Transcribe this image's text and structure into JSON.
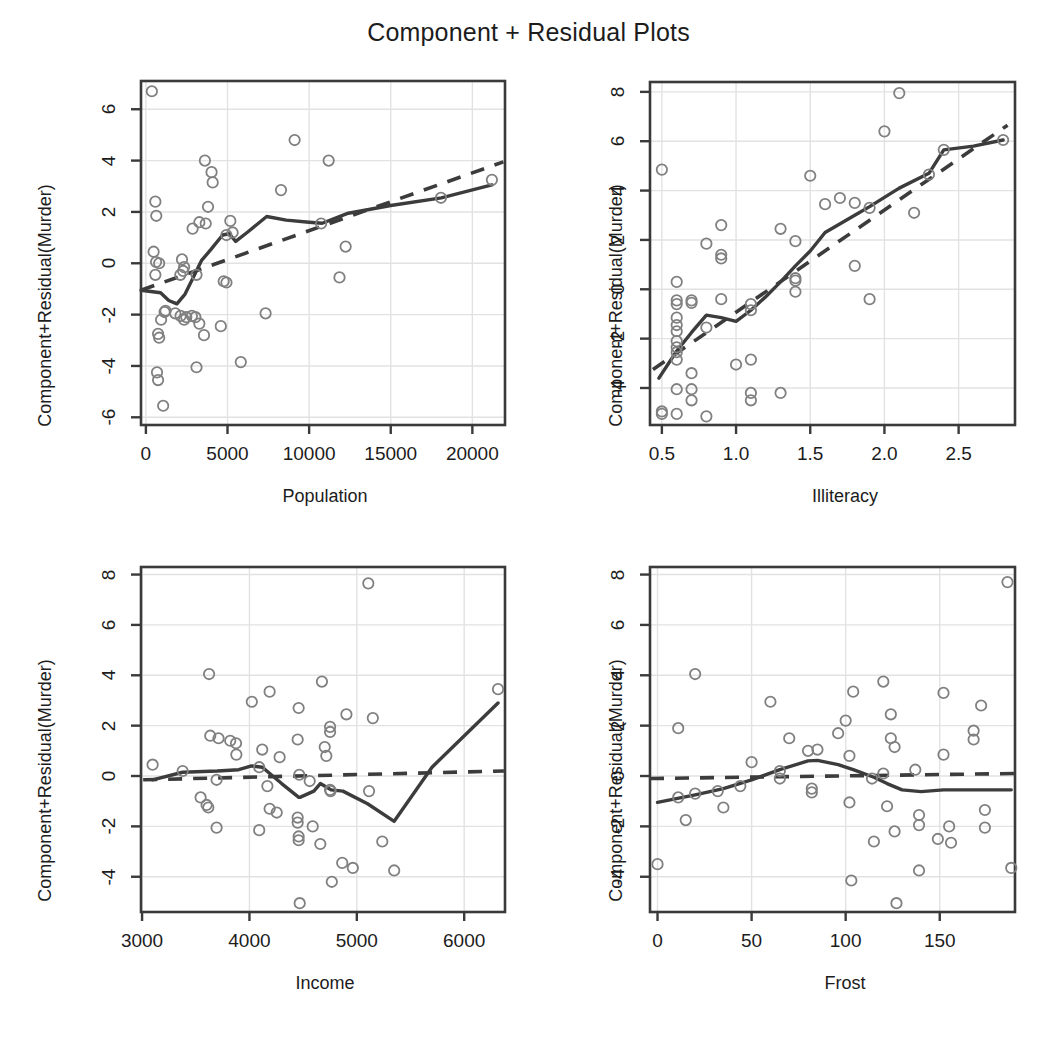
{
  "figure": {
    "title": "Component + Residual Plots",
    "background": "#ffffff",
    "point_color": "#808080",
    "line_color": "#3c3c3c",
    "frame_color": "#3a3a3a",
    "grid_color": "#e2e2e2",
    "text_color": "#1c1c1c"
  },
  "chart_data": [
    {
      "type": "scatter",
      "panel": "top-left",
      "title": "Component + Residual Plots",
      "xlabel": "Population",
      "ylabel": "Component+Residual(Murder)",
      "xlim": [
        -300,
        22000
      ],
      "ylim": [
        -6.3,
        7.1
      ],
      "xticks": [
        0,
        5000,
        10000,
        15000,
        20000
      ],
      "yticks": [
        -6,
        -4,
        -2,
        0,
        2,
        4,
        6
      ],
      "xticklabels": [
        "0",
        "5000",
        "10000",
        "15000",
        "20000"
      ],
      "yticklabels": [
        "-6",
        "-4",
        "-2",
        "0",
        "2",
        "4",
        "6"
      ],
      "grid": true,
      "legend": "none",
      "points": [
        [
          365,
          6.7
        ],
        [
          579,
          2.4
        ],
        [
          637,
          1.85
        ],
        [
          472,
          0.45
        ],
        [
          623,
          0.05
        ],
        [
          812,
          0.0
        ],
        [
          579,
          -0.45
        ],
        [
          1203,
          -1.85
        ],
        [
          931,
          -2.2
        ],
        [
          1144,
          -1.9
        ],
        [
          746,
          -2.75
        ],
        [
          813,
          -2.9
        ],
        [
          681,
          -4.25
        ],
        [
          746,
          -4.55
        ],
        [
          1058,
          -5.55
        ],
        [
          2341,
          -0.15
        ],
        [
          2212,
          0.15
        ],
        [
          2110,
          -0.45
        ],
        [
          2861,
          1.35
        ],
        [
          2284,
          -0.3
        ],
        [
          3100,
          -0.45
        ],
        [
          3615,
          4.0
        ],
        [
          4022,
          3.55
        ],
        [
          4091,
          3.15
        ],
        [
          3806,
          2.2
        ],
        [
          3274,
          1.6
        ],
        [
          3665,
          1.55
        ],
        [
          4931,
          1.1
        ],
        [
          5313,
          1.2
        ],
        [
          5173,
          1.65
        ],
        [
          2341,
          -2.2
        ],
        [
          2816,
          -2.05
        ],
        [
          3032,
          -2.1
        ],
        [
          3274,
          -2.35
        ],
        [
          2477,
          -2.1
        ],
        [
          1799,
          -1.95
        ],
        [
          2126,
          -2.05
        ],
        [
          3559,
          -2.8
        ],
        [
          4589,
          -2.45
        ],
        [
          3100,
          -4.05
        ],
        [
          5814,
          -3.85
        ],
        [
          4767,
          -0.7
        ],
        [
          4935,
          -0.75
        ],
        [
          7333,
          -1.95
        ],
        [
          8277,
          2.85
        ],
        [
          9111,
          4.8
        ],
        [
          10735,
          1.55
        ],
        [
          11197,
          4.0
        ],
        [
          11860,
          -0.55
        ],
        [
          12237,
          0.65
        ],
        [
          18076,
          2.55
        ],
        [
          21198,
          3.25
        ]
      ],
      "lowess": [
        [
          -300,
          -1.05
        ],
        [
          900,
          -1.15
        ],
        [
          1400,
          -1.45
        ],
        [
          1900,
          -1.58
        ],
        [
          2400,
          -1.2
        ],
        [
          2900,
          -0.55
        ],
        [
          3400,
          0.1
        ],
        [
          4000,
          0.55
        ],
        [
          4700,
          1.1
        ],
        [
          5100,
          1.15
        ],
        [
          5500,
          0.85
        ],
        [
          6200,
          1.2
        ],
        [
          7400,
          1.82
        ],
        [
          8600,
          1.68
        ],
        [
          10000,
          1.6
        ],
        [
          10800,
          1.56
        ],
        [
          12400,
          1.95
        ],
        [
          15000,
          2.25
        ],
        [
          18100,
          2.55
        ],
        [
          21198,
          3.05
        ]
      ],
      "linear": [
        [
          -300,
          -1.05
        ],
        [
          21900,
          3.95
        ]
      ]
    },
    {
      "type": "scatter",
      "panel": "top-right",
      "xlabel": "Illiteracy",
      "ylabel": "Component+Residual(Murder)",
      "xlim": [
        0.42,
        2.88
      ],
      "ylim": [
        -5.5,
        8.4
      ],
      "xticks": [
        0.5,
        1.0,
        1.5,
        2.0,
        2.5
      ],
      "yticks": [
        -4,
        -2,
        0,
        2,
        4,
        6,
        8
      ],
      "xticklabels": [
        "0.5",
        "1.0",
        "1.5",
        "2.0",
        "2.5"
      ],
      "yticklabels": [
        "-4",
        "-2",
        "0",
        "2",
        "4",
        "6",
        "8"
      ],
      "grid": true,
      "legend": "none",
      "points": [
        [
          0.5,
          4.85
        ],
        [
          0.5,
          -4.95
        ],
        [
          0.5,
          -5.05
        ],
        [
          0.6,
          0.3
        ],
        [
          0.6,
          -0.45
        ],
        [
          0.6,
          -0.6
        ],
        [
          0.6,
          -1.15
        ],
        [
          0.6,
          -1.45
        ],
        [
          0.6,
          -1.7
        ],
        [
          0.6,
          -2.1
        ],
        [
          0.6,
          -2.35
        ],
        [
          0.6,
          -2.55
        ],
        [
          0.6,
          -2.85
        ],
        [
          0.6,
          -4.05
        ],
        [
          0.6,
          -5.05
        ],
        [
          0.7,
          -0.45
        ],
        [
          0.7,
          -0.55
        ],
        [
          0.7,
          -3.4
        ],
        [
          0.7,
          -4.05
        ],
        [
          0.7,
          -4.5
        ],
        [
          0.8,
          1.85
        ],
        [
          0.8,
          -1.55
        ],
        [
          0.9,
          2.6
        ],
        [
          0.9,
          1.4
        ],
        [
          0.9,
          1.25
        ],
        [
          0.9,
          -0.4
        ],
        [
          0.8,
          -5.15
        ],
        [
          1.0,
          -3.05
        ],
        [
          1.1,
          -2.85
        ],
        [
          1.1,
          -0.6
        ],
        [
          1.1,
          -0.85
        ],
        [
          1.1,
          -4.2
        ],
        [
          1.1,
          -4.5
        ],
        [
          1.3,
          2.45
        ],
        [
          1.3,
          -4.2
        ],
        [
          1.4,
          1.95
        ],
        [
          1.4,
          0.45
        ],
        [
          1.4,
          0.35
        ],
        [
          1.4,
          -0.1
        ],
        [
          1.5,
          4.6
        ],
        [
          1.6,
          3.45
        ],
        [
          1.7,
          3.7
        ],
        [
          1.8,
          3.5
        ],
        [
          1.8,
          0.95
        ],
        [
          1.9,
          3.3
        ],
        [
          1.9,
          -0.4
        ],
        [
          2.0,
          6.4
        ],
        [
          2.1,
          7.95
        ],
        [
          2.2,
          3.1
        ],
        [
          2.3,
          4.65
        ],
        [
          2.4,
          5.65
        ],
        [
          2.8,
          6.05
        ]
      ],
      "lowess": [
        [
          0.48,
          -3.6
        ],
        [
          0.6,
          -2.5
        ],
        [
          0.7,
          -1.75
        ],
        [
          0.8,
          -1.05
        ],
        [
          0.9,
          -1.15
        ],
        [
          1.0,
          -1.3
        ],
        [
          1.1,
          -0.85
        ],
        [
          1.2,
          -0.3
        ],
        [
          1.3,
          0.3
        ],
        [
          1.4,
          0.95
        ],
        [
          1.5,
          1.55
        ],
        [
          1.6,
          2.3
        ],
        [
          1.8,
          3.0
        ],
        [
          1.9,
          3.35
        ],
        [
          2.1,
          4.1
        ],
        [
          2.3,
          4.7
        ],
        [
          2.4,
          5.65
        ],
        [
          2.6,
          5.8
        ],
        [
          2.8,
          6.05
        ]
      ],
      "linear": [
        [
          0.44,
          -3.25
        ],
        [
          2.83,
          6.65
        ]
      ]
    },
    {
      "type": "scatter",
      "panel": "bottom-left",
      "xlabel": "Income",
      "ylabel": "Component+Residual(Murder)",
      "xlim": [
        2990,
        6380
      ],
      "ylim": [
        -5.4,
        8.3
      ],
      "xticks": [
        3000,
        4000,
        5000,
        6000
      ],
      "yticks": [
        -4,
        -2,
        0,
        2,
        4,
        6,
        8
      ],
      "xticklabels": [
        "3000",
        "4000",
        "5000",
        "6000"
      ],
      "yticklabels": [
        "-4",
        "-2",
        "0",
        "2",
        "4",
        "6",
        "8"
      ],
      "grid": true,
      "legend": "none",
      "points": [
        [
          3098,
          0.45
        ],
        [
          3378,
          0.2
        ],
        [
          3545,
          -0.85
        ],
        [
          3601,
          -1.15
        ],
        [
          3617,
          -1.25
        ],
        [
          3624,
          4.05
        ],
        [
          3635,
          1.6
        ],
        [
          3694,
          -0.15
        ],
        [
          3712,
          1.5
        ],
        [
          3821,
          1.4
        ],
        [
          3875,
          1.3
        ],
        [
          3878,
          0.85
        ],
        [
          3694,
          -2.05
        ],
        [
          4022,
          2.95
        ],
        [
          4091,
          0.35
        ],
        [
          4119,
          1.05
        ],
        [
          4167,
          -0.4
        ],
        [
          4091,
          -2.15
        ],
        [
          4188,
          3.35
        ],
        [
          4188,
          -1.3
        ],
        [
          4254,
          -1.45
        ],
        [
          4281,
          0.75
        ],
        [
          4449,
          1.45
        ],
        [
          4458,
          2.7
        ],
        [
          4449,
          -1.65
        ],
        [
          4449,
          -1.85
        ],
        [
          4458,
          -2.4
        ],
        [
          4458,
          -2.55
        ],
        [
          4464,
          0.05
        ],
        [
          4468,
          -5.05
        ],
        [
          4561,
          -0.2
        ],
        [
          4589,
          -2.0
        ],
        [
          4660,
          -2.7
        ],
        [
          4675,
          3.75
        ],
        [
          4701,
          1.15
        ],
        [
          4716,
          0.8
        ],
        [
          4751,
          1.95
        ],
        [
          4751,
          1.75
        ],
        [
          4751,
          -0.55
        ],
        [
          4756,
          -0.6
        ],
        [
          4767,
          -4.2
        ],
        [
          4864,
          -3.45
        ],
        [
          4903,
          2.45
        ],
        [
          4963,
          -3.65
        ],
        [
          5107,
          7.65
        ],
        [
          5114,
          -0.6
        ],
        [
          5149,
          2.3
        ],
        [
          5237,
          -2.6
        ],
        [
          5348,
          -3.75
        ],
        [
          6315,
          3.45
        ]
      ],
      "lowess": [
        [
          3098,
          -0.15
        ],
        [
          3378,
          0.15
        ],
        [
          3700,
          0.2
        ],
        [
          3900,
          0.25
        ],
        [
          4020,
          0.4
        ],
        [
          4120,
          0.35
        ],
        [
          4300,
          -0.3
        ],
        [
          4460,
          -0.85
        ],
        [
          4470,
          -0.85
        ],
        [
          4600,
          -0.6
        ],
        [
          4660,
          -0.3
        ],
        [
          4700,
          -0.4
        ],
        [
          4760,
          -0.55
        ],
        [
          4870,
          -0.6
        ],
        [
          5100,
          -1.1
        ],
        [
          5348,
          -1.8
        ],
        [
          5700,
          0.35
        ],
        [
          6315,
          2.9
        ]
      ],
      "linear": [
        [
          3010,
          -0.15
        ],
        [
          6370,
          0.2
        ]
      ]
    },
    {
      "type": "scatter",
      "panel": "bottom-right",
      "xlabel": "Frost",
      "ylabel": "Component+Residual(Murder)",
      "xlim": [
        -4,
        190
      ],
      "ylim": [
        -5.4,
        8.3
      ],
      "xticks": [
        0,
        50,
        100,
        150
      ],
      "yticks": [
        -4,
        -2,
        0,
        2,
        4,
        6,
        8
      ],
      "xticklabels": [
        "0",
        "50",
        "100",
        "150"
      ],
      "yticklabels": [
        "-4",
        "-2",
        "0",
        "2",
        "4",
        "6",
        "8"
      ],
      "grid": true,
      "legend": "none",
      "points": [
        [
          0,
          -3.5
        ],
        [
          11,
          1.9
        ],
        [
          11,
          -0.85
        ],
        [
          15,
          -1.75
        ],
        [
          20,
          4.05
        ],
        [
          20,
          -0.7
        ],
        [
          32,
          -0.6
        ],
        [
          35,
          -1.25
        ],
        [
          44,
          -0.4
        ],
        [
          50,
          0.55
        ],
        [
          60,
          2.95
        ],
        [
          65,
          0.2
        ],
        [
          65,
          -0.1
        ],
        [
          70,
          1.5
        ],
        [
          80,
          1.0
        ],
        [
          82,
          -0.5
        ],
        [
          82,
          -0.65
        ],
        [
          85,
          1.05
        ],
        [
          96,
          1.7
        ],
        [
          100,
          2.2
        ],
        [
          102,
          0.8
        ],
        [
          102,
          -1.05
        ],
        [
          103,
          -4.15
        ],
        [
          104,
          3.35
        ],
        [
          114,
          -0.1
        ],
        [
          115,
          -2.6
        ],
        [
          120,
          0.1
        ],
        [
          120,
          3.75
        ],
        [
          122,
          -1.2
        ],
        [
          124,
          2.45
        ],
        [
          124,
          1.5
        ],
        [
          126,
          1.15
        ],
        [
          126,
          -2.2
        ],
        [
          127,
          -5.05
        ],
        [
          137,
          0.25
        ],
        [
          139,
          -1.55
        ],
        [
          139,
          -1.95
        ],
        [
          139,
          -3.75
        ],
        [
          149,
          -2.5
        ],
        [
          152,
          3.3
        ],
        [
          152,
          0.85
        ],
        [
          155,
          -2.0
        ],
        [
          156,
          -2.65
        ],
        [
          168,
          1.8
        ],
        [
          168,
          1.45
        ],
        [
          172,
          2.8
        ],
        [
          174,
          -1.35
        ],
        [
          174,
          -2.05
        ],
        [
          186,
          7.7
        ],
        [
          188,
          -3.65
        ]
      ],
      "lowess": [
        [
          0,
          -1.05
        ],
        [
          20,
          -0.75
        ],
        [
          35,
          -0.5
        ],
        [
          50,
          -0.15
        ],
        [
          65,
          0.25
        ],
        [
          80,
          0.6
        ],
        [
          85,
          0.62
        ],
        [
          96,
          0.45
        ],
        [
          104,
          0.25
        ],
        [
          115,
          -0.05
        ],
        [
          122,
          -0.3
        ],
        [
          130,
          -0.55
        ],
        [
          140,
          -0.62
        ],
        [
          152,
          -0.55
        ],
        [
          168,
          -0.55
        ],
        [
          188,
          -0.55
        ]
      ],
      "linear": [
        [
          -4,
          -0.1
        ],
        [
          190,
          0.1
        ]
      ]
    }
  ]
}
